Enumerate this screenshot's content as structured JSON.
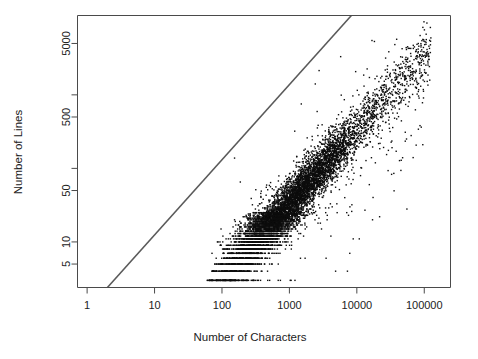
{
  "chart_data": {
    "type": "scatter",
    "title": "",
    "xlabel": "Number of Characters",
    "ylabel": "Number of Lines",
    "xscale": "log",
    "yscale": "log",
    "xlim": [
      0.72,
      245000
    ],
    "ylim": [
      2.4,
      12000
    ],
    "grid": false,
    "legend": null,
    "xticks": [
      1,
      10,
      100,
      1000,
      10000,
      100000
    ],
    "xticklabels": [
      "1",
      "10",
      "100",
      "1000",
      "10000",
      "100000"
    ],
    "yticks": [
      5,
      10,
      50,
      500,
      5000
    ],
    "yticklabels": [
      "5",
      "10",
      "50",
      "500",
      "5000"
    ],
    "y_unlabeled_ticks": [
      100,
      1000
    ],
    "marker": "point",
    "marker_color": "#0d0d0d",
    "marker_size_px": 1.4,
    "n_points": 5200,
    "annotations": [
      {
        "kind": "reference-line",
        "description": "diagonal identity-like guide line with slope 1 on log-log axes",
        "x_start": 2.0,
        "y_start": 2.4,
        "x_end": 8300,
        "y_end": 12000,
        "color": "#5a5a5a"
      }
    ],
    "relationship": {
      "description": "Number of Lines grows roughly proportionally to Number of Characters, about 30 characters per line; points form a dense band below the guide line with horizontal striping at small integer line counts.",
      "chars_per_line": 30,
      "scatter_log_sd": 0.17
    },
    "series": [
      {
        "name": "documents",
        "x_range": [
          60,
          150000
        ],
        "y_range": [
          3,
          2400
        ],
        "cloud_description": "dense elongated band from (x~200, y~6) up to (x~60000, y~1200) with sparse outliers above and below"
      }
    ]
  },
  "axes": {
    "x_label": "Number of Characters",
    "y_label": "Number of Lines"
  },
  "ticks": {
    "x": [
      "1",
      "10",
      "100",
      "1000",
      "10000",
      "100000"
    ],
    "y": [
      "5000",
      "500",
      "50",
      "10",
      "5"
    ]
  },
  "colors": {
    "point": "#0d0d0d",
    "frame": "#4a4a4a",
    "reference_line": "#5a5a5a",
    "background": "#ffffff",
    "text": "#222222"
  }
}
